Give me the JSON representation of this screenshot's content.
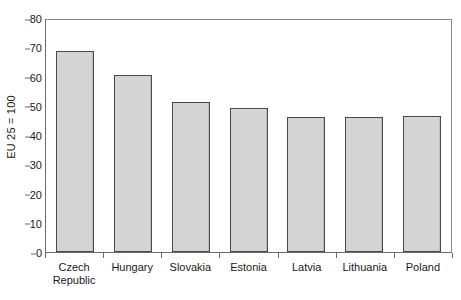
{
  "chart_data": {
    "type": "bar",
    "title": "",
    "subtitle": "",
    "xlabel": "",
    "ylabel": "EU 25 = 100",
    "categories": [
      "Czech Republic",
      "Hungary",
      "Slovakia",
      "Estonia",
      "Latvia",
      "Lithuania",
      "Poland"
    ],
    "category_label_lines": [
      [
        "Czech",
        "Republic"
      ],
      [
        "Hungary"
      ],
      [
        "Slovakia"
      ],
      [
        "Estonia"
      ],
      [
        "Latvia"
      ],
      [
        "Lithuania"
      ],
      [
        "Poland"
      ]
    ],
    "values": [
      69,
      61,
      51.5,
      49.5,
      46.5,
      46.5,
      47
    ],
    "ylim": [
      0,
      80
    ],
    "ytick_step": 10,
    "yticks": [
      0,
      10,
      20,
      30,
      40,
      50,
      60,
      70,
      80
    ],
    "ytick_labels": [
      "0",
      "10",
      "20",
      "30",
      "40",
      "50",
      "60",
      "70",
      "80"
    ],
    "grid": false,
    "legend": null,
    "legend_position": "none",
    "annotations": [],
    "colors": {
      "bar_fill": "#d4d4d4",
      "bar_border": "#4a4a4a",
      "axis_line": "#6b6b6b",
      "frame_line": "#8a8a8a",
      "text": "#1a1a1a",
      "background": "#ffffff"
    }
  }
}
